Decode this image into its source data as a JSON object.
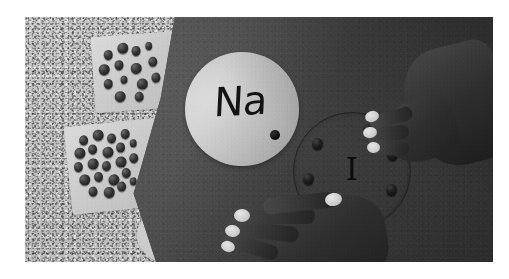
{
  "image": {
    "kind": "photograph",
    "color_mode": "grayscale",
    "scene_title": "Lewis dot structure classroom demonstration",
    "frame": {
      "margin_color": "#ffffff",
      "photo_bg": "#b9b9b9"
    }
  },
  "surface": {
    "name": "countertop",
    "description": "speckled granite countertop",
    "color": "#bdbdbd"
  },
  "plate": {
    "name": "paper plate",
    "color": "#cbcbcb"
  },
  "board": {
    "name": "dark construction paper",
    "color": "#585858",
    "shadow_color": "#000000"
  },
  "elements": [
    {
      "symbol": "Na",
      "name": "sodium",
      "representation": "light paper circle with handwritten symbol",
      "valence_electrons": 1,
      "circle_color": "#d2d2d2",
      "text_color": "#161616",
      "dot_color": "#0c0c0c",
      "dot_angles_deg": [
        40
      ]
    },
    {
      "symbol": "I",
      "name": "iodine",
      "representation": "circle drawn on dark board with bead electrons",
      "valence_electrons": 7,
      "ring_color": "#141414",
      "text_color": "#121212",
      "dot_color": "#0e0e0e",
      "dot_angles_deg": [
        -68,
        -22,
        26,
        74,
        122,
        170,
        218
      ]
    }
  ],
  "bead_trays": [
    {
      "name": "upper bead tray",
      "tray_color": "#cfcfcf",
      "bead_color": "#1a1a1a",
      "bead_count": 14,
      "beads": [
        {
          "x": 12,
          "y": 14,
          "size": "md"
        },
        {
          "x": 26,
          "y": 8,
          "size": "lg"
        },
        {
          "x": 40,
          "y": 12,
          "size": "md"
        },
        {
          "x": 54,
          "y": 9,
          "size": "sm"
        },
        {
          "x": 6,
          "y": 28,
          "size": "lg"
        },
        {
          "x": 22,
          "y": 25,
          "size": "md"
        },
        {
          "x": 38,
          "y": 29,
          "size": "lg"
        },
        {
          "x": 56,
          "y": 24,
          "size": "md"
        },
        {
          "x": 10,
          "y": 43,
          "size": "md"
        },
        {
          "x": 27,
          "y": 41,
          "size": "sm"
        },
        {
          "x": 43,
          "y": 45,
          "size": "lg"
        },
        {
          "x": 58,
          "y": 40,
          "size": "md"
        },
        {
          "x": 20,
          "y": 56,
          "size": "lg"
        },
        {
          "x": 40,
          "y": 58,
          "size": "md"
        }
      ]
    },
    {
      "name": "lower bead tray",
      "tray_color": "#cbcbcb",
      "bead_color": "#161616",
      "bead_count": 22,
      "beads": [
        {
          "x": 14,
          "y": 10,
          "size": "md"
        },
        {
          "x": 28,
          "y": 6,
          "size": "lg"
        },
        {
          "x": 42,
          "y": 11,
          "size": "md"
        },
        {
          "x": 56,
          "y": 8,
          "size": "md"
        },
        {
          "x": 8,
          "y": 22,
          "size": "lg"
        },
        {
          "x": 22,
          "y": 20,
          "size": "md"
        },
        {
          "x": 36,
          "y": 24,
          "size": "lg"
        },
        {
          "x": 50,
          "y": 21,
          "size": "md"
        },
        {
          "x": 64,
          "y": 19,
          "size": "sm"
        },
        {
          "x": 6,
          "y": 36,
          "size": "md"
        },
        {
          "x": 20,
          "y": 34,
          "size": "lg"
        },
        {
          "x": 34,
          "y": 38,
          "size": "md"
        },
        {
          "x": 48,
          "y": 35,
          "size": "lg"
        },
        {
          "x": 62,
          "y": 33,
          "size": "md"
        },
        {
          "x": 10,
          "y": 49,
          "size": "lg"
        },
        {
          "x": 25,
          "y": 48,
          "size": "md"
        },
        {
          "x": 39,
          "y": 52,
          "size": "lg"
        },
        {
          "x": 53,
          "y": 47,
          "size": "md"
        },
        {
          "x": 18,
          "y": 62,
          "size": "md"
        },
        {
          "x": 33,
          "y": 64,
          "size": "lg"
        },
        {
          "x": 47,
          "y": 60,
          "size": "md"
        },
        {
          "x": 60,
          "y": 57,
          "size": "sm"
        }
      ]
    }
  ],
  "hands": [
    {
      "name": "left hand",
      "position": "lower center, resting on board",
      "nail_color": "#d9d4cc",
      "skin_color": "#332f2d"
    },
    {
      "name": "right hand",
      "position": "upper right, reaching toward iodine circle",
      "nail_color": "#d9d4cc",
      "skin_color": "#332f2d"
    }
  ]
}
